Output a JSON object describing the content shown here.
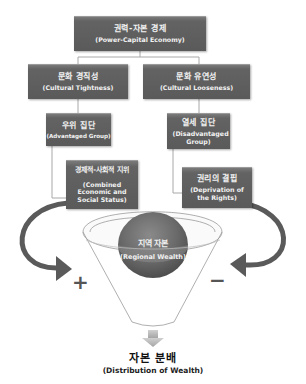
{
  "diagram": {
    "root": {
      "ko": "권력-자본 경제",
      "en": "(Power-Capital Economy)"
    },
    "left_branch": {
      "level1": {
        "ko": "문화 경직성",
        "en": "(Cultural Tightness)"
      },
      "level2": {
        "ko": "우위 집단",
        "en": "(Advantaged Group)"
      },
      "level3": {
        "ko": "경제적-사회적 지위",
        "en": "(Combined Economic and Social Status)"
      },
      "sign": "+"
    },
    "right_branch": {
      "level1": {
        "ko": "문화 유연성",
        "en": "(Cultural Looseness)"
      },
      "level2": {
        "ko": "열세 집단",
        "en": "(Disadvantaged Group)"
      },
      "level3": {
        "ko": "권리의 결핍",
        "en": "(Deprivation of the Rights)"
      },
      "sign": "−"
    },
    "center": {
      "ko": "지역 자본",
      "en": "(Regional Wealth)"
    },
    "output": {
      "ko": "자본 분배",
      "en": "(Distribution of Wealth)"
    },
    "colors": {
      "box_fill": "#5f5f5f",
      "arrow": "#5a5a5a",
      "ball": "#6a6a6a",
      "connector": "#a8a8a8",
      "down_arrow": "#bdbdbd"
    }
  }
}
